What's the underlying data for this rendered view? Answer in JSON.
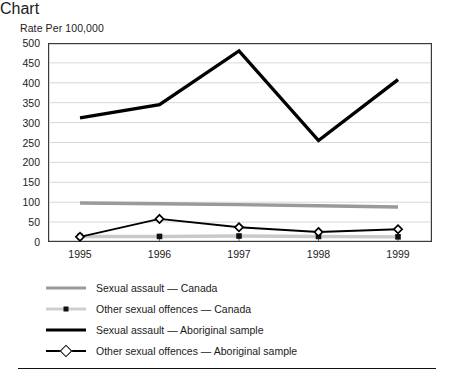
{
  "chart_data": {
    "type": "line",
    "title": "",
    "ylabel": "Rate Per 100,000",
    "xlabel": "",
    "categories": [
      "1995",
      "1996",
      "1997",
      "1998",
      "1999"
    ],
    "x": [
      1995,
      1996,
      1997,
      1998,
      1999
    ],
    "ylim": [
      0,
      500
    ],
    "ytick_step": 50,
    "yticks": [
      "500",
      "450",
      "400",
      "350",
      "300",
      "250",
      "200",
      "150",
      "100",
      "50",
      "0"
    ],
    "grid": "horizontal",
    "legend_position": "below",
    "series": [
      {
        "name": "Sexual assault — Canada",
        "values": [
          98,
          96,
          94,
          91,
          88
        ],
        "color": "#9a9a9a",
        "style": "thick-solid",
        "marker": "none"
      },
      {
        "name": "Other sexual offences — Canada",
        "values": [
          14,
          14,
          15,
          14,
          13
        ],
        "color": "#c9c9c9",
        "style": "thick-solid",
        "marker": "filled-square"
      },
      {
        "name": "Sexual assault — Aboriginal sample",
        "values": [
          312,
          345,
          480,
          255,
          408
        ],
        "color": "#000000",
        "style": "thick-solid",
        "marker": "none"
      },
      {
        "name": "Other sexual offences — Aboriginal sample",
        "values": [
          13,
          58,
          37,
          25,
          32
        ],
        "color": "#000000",
        "style": "solid",
        "marker": "open-diamond"
      }
    ]
  },
  "legend": {
    "items": [
      {
        "label": "Sexual assault — Canada",
        "icon": "gray-thick-line-icon"
      },
      {
        "label": "Other sexual offences — Canada",
        "icon": "light-gray-line-square-marker-icon"
      },
      {
        "label": "Sexual assault — Aboriginal sample",
        "icon": "black-thick-line-icon"
      },
      {
        "label": "Other sexual offences — Aboriginal sample",
        "icon": "black-line-diamond-marker-icon"
      }
    ]
  }
}
